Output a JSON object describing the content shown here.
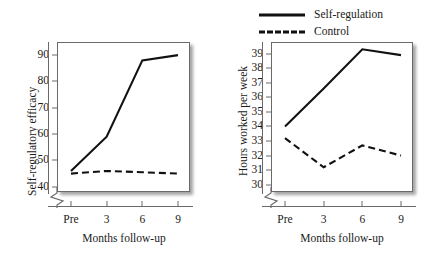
{
  "legend": {
    "position": "top-right",
    "entries": [
      {
        "label": "Self-regulation",
        "style": "solid"
      },
      {
        "label": "Control",
        "style": "dashed"
      }
    ]
  },
  "charts": [
    {
      "id": "self-regulatory-efficacy",
      "ylabel": "Self-regulatory efficacy",
      "xlabel": "Months follow-up",
      "yticks": [
        "90",
        "80",
        "70",
        "60",
        "50",
        "40"
      ],
      "xticks": [
        "Pre",
        "3",
        "6",
        "9"
      ],
      "axis_break": true
    },
    {
      "id": "hours-worked-per-week",
      "ylabel": "Hours worked per week",
      "ylabel_line1": "Hours worked per",
      "ylabel_line2": "week",
      "xlabel": "Months follow-up",
      "yticks": [
        "39",
        "38",
        "37",
        "36",
        "35",
        "34",
        "33",
        "32",
        "31",
        "30"
      ],
      "xticks": [
        "Pre",
        "3",
        "6",
        "9"
      ],
      "axis_break": true
    }
  ],
  "chart_data": [
    {
      "type": "line",
      "title": "",
      "xlabel": "Months follow-up",
      "ylabel": "Self-regulatory efficacy",
      "categories": [
        "Pre",
        "3",
        "6",
        "9"
      ],
      "x": [
        0,
        3,
        6,
        9
      ],
      "ylim": [
        38,
        95
      ],
      "yticks": [
        40,
        50,
        60,
        70,
        80,
        90
      ],
      "grid": false,
      "axis_break_y": true,
      "legend": "shared-top-right",
      "series": [
        {
          "name": "Self-regulation",
          "style": "solid",
          "color": "#111111",
          "values": [
            46,
            59,
            88,
            90
          ]
        },
        {
          "name": "Control",
          "style": "dashed",
          "color": "#111111",
          "values": [
            45,
            46,
            45.5,
            45
          ]
        }
      ]
    },
    {
      "type": "line",
      "title": "",
      "xlabel": "Months follow-up",
      "ylabel": "Hours worked per week",
      "categories": [
        "Pre",
        "3",
        "6",
        "9"
      ],
      "x": [
        0,
        3,
        6,
        9
      ],
      "ylim": [
        29.5,
        39.8
      ],
      "yticks": [
        30,
        31,
        32,
        33,
        34,
        35,
        36,
        37,
        38,
        39
      ],
      "grid": false,
      "axis_break_y": true,
      "legend": "shared-top-right",
      "series": [
        {
          "name": "Self-regulation",
          "style": "solid",
          "color": "#111111",
          "values": [
            34.0,
            36.6,
            39.3,
            38.9
          ]
        },
        {
          "name": "Control",
          "style": "dashed",
          "color": "#111111",
          "values": [
            33.2,
            31.2,
            32.7,
            32.0
          ]
        }
      ]
    }
  ]
}
